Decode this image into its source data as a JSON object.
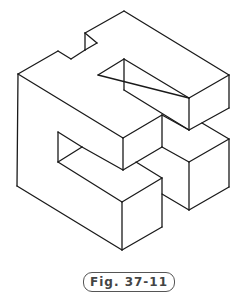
{
  "figure": {
    "stroke_color": "#1a1a1a",
    "lines": [
      [
        18,
        74,
        58,
        51
      ],
      [
        58,
        51,
        71,
        59
      ],
      [
        71,
        59,
        85,
        50
      ],
      [
        85,
        50,
        85,
        33
      ],
      [
        85,
        33,
        124,
        11
      ],
      [
        85,
        33,
        97,
        43
      ],
      [
        97,
        43,
        85,
        50
      ],
      [
        124,
        11,
        229,
        75
      ],
      [
        229,
        75,
        189,
        98
      ],
      [
        189,
        98,
        98,
        75
      ],
      [
        98,
        75,
        124,
        59
      ],
      [
        124,
        59,
        124,
        90
      ],
      [
        124,
        59,
        189,
        98
      ],
      [
        189,
        98,
        189,
        130
      ],
      [
        229,
        75,
        229,
        108
      ],
      [
        229,
        108,
        189,
        130
      ],
      [
        124,
        90,
        189,
        130
      ],
      [
        18,
        74,
        123,
        138
      ],
      [
        123,
        138,
        162,
        115
      ],
      [
        162,
        115,
        162,
        147
      ],
      [
        123,
        138,
        123,
        170
      ],
      [
        162,
        115,
        189,
        130
      ],
      [
        202,
        123,
        229,
        139
      ],
      [
        229,
        139,
        189,
        162
      ],
      [
        189,
        162,
        162,
        147
      ],
      [
        189,
        162,
        189,
        210
      ],
      [
        229,
        139,
        229,
        187
      ],
      [
        229,
        187,
        189,
        210
      ],
      [
        189,
        210,
        162,
        194
      ],
      [
        58,
        132,
        82,
        147
      ],
      [
        58,
        132,
        58,
        162
      ],
      [
        58,
        162,
        122,
        202
      ],
      [
        82,
        147,
        123,
        170
      ],
      [
        123,
        170,
        162,
        147
      ],
      [
        136,
        162,
        162,
        178
      ],
      [
        122,
        202,
        162,
        178
      ],
      [
        162,
        178,
        162,
        227
      ],
      [
        122,
        202,
        122,
        250
      ],
      [
        122,
        250,
        162,
        227
      ],
      [
        18,
        74,
        17,
        186
      ],
      [
        17,
        186,
        122,
        250
      ],
      [
        58,
        162,
        82,
        147
      ]
    ]
  },
  "caption": {
    "text": "Fig. 37-11"
  }
}
